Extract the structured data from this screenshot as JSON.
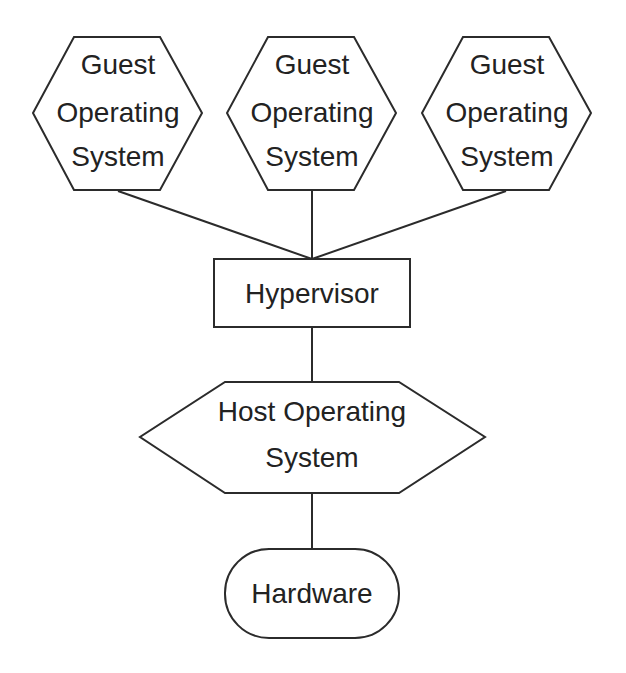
{
  "diagram": {
    "title": "",
    "nodes": {
      "guest1": {
        "lines": [
          "Guest",
          "Operating",
          "System"
        ],
        "shape": "hexagon"
      },
      "guest2": {
        "lines": [
          "Guest",
          "Operating",
          "System"
        ],
        "shape": "hexagon"
      },
      "guest3": {
        "lines": [
          "Guest",
          "Operating",
          "System"
        ],
        "shape": "hexagon"
      },
      "hypervisor": {
        "lines": [
          "Hypervisor"
        ],
        "shape": "rectangle"
      },
      "host": {
        "lines": [
          "Host Operating",
          "System"
        ],
        "shape": "wide-hexagon"
      },
      "hardware": {
        "lines": [
          "Hardware"
        ],
        "shape": "rounded-rectangle"
      }
    },
    "edges": [
      {
        "from": "guest1",
        "to": "hypervisor"
      },
      {
        "from": "guest2",
        "to": "hypervisor"
      },
      {
        "from": "guest3",
        "to": "hypervisor"
      },
      {
        "from": "hypervisor",
        "to": "host"
      },
      {
        "from": "host",
        "to": "hardware"
      }
    ],
    "colors": {
      "stroke": "#2b2b2b",
      "fill": "#ffffff",
      "text": "#222222"
    }
  }
}
